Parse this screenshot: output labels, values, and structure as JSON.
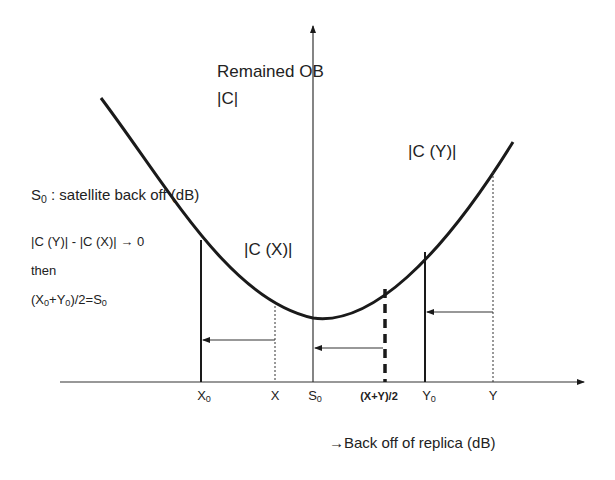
{
  "diagram": {
    "title_y_axis": "Remained OB",
    "y_axis_sublabel": "|C|",
    "x_axis_label": "→Back off of replica (dB)",
    "curve_labels": {
      "cx": "|C (X)|",
      "cy": "|C (Y)|"
    },
    "notes": {
      "s0_prefix": "S",
      "s0_sub": "0",
      "s0_text": " : satellite back off (dB)",
      "condition": "|C (Y)| - |C (X)| → 0",
      "then": "then",
      "result_a": "(X",
      "result_a_sub": "0",
      "result_b": "+Y",
      "result_b_sub": "0",
      "result_c": ")/2=S",
      "result_c_sub": "0"
    },
    "ticks": {
      "x0": {
        "main": "X",
        "sub": "0"
      },
      "x": {
        "main": "X",
        "sub": ""
      },
      "s0": {
        "main": "S",
        "sub": "0"
      },
      "mid": {
        "main": "(X+Y)/2",
        "sub": ""
      },
      "y0": {
        "main": "Y",
        "sub": "0"
      },
      "y": {
        "main": "Y",
        "sub": ""
      }
    },
    "colors": {
      "line": "#1a1a1a",
      "background": "#ffffff"
    }
  }
}
